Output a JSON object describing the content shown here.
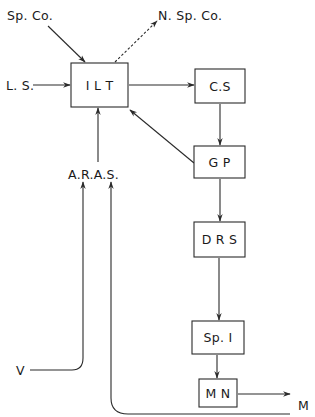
{
  "diagram": {
    "nodes": {
      "ilt": {
        "label": "I L T"
      },
      "cs": {
        "label": "C.S"
      },
      "gp": {
        "label": "G P"
      },
      "drs": {
        "label": "D R S"
      },
      "spi": {
        "label": "Sp. I"
      },
      "mn": {
        "label": "M N"
      }
    },
    "inputs": {
      "spco": {
        "label": "Sp. Co."
      },
      "ls": {
        "label": "L. S."
      },
      "aras": {
        "label": "A.R.A.S."
      },
      "v": {
        "label": "V"
      },
      "m": {
        "label": "M"
      }
    },
    "outputs": {
      "nspco": {
        "label": "N. Sp. Co."
      }
    },
    "edges": [
      {
        "from": "Sp. Co.",
        "to": "I L T",
        "style": "solid"
      },
      {
        "from": "I L T",
        "to": "N. Sp. Co.",
        "style": "dashed"
      },
      {
        "from": "L. S.",
        "to": "I L T",
        "style": "solid"
      },
      {
        "from": "I L T",
        "to": "C.S",
        "style": "solid"
      },
      {
        "from": "C.S",
        "to": "G P",
        "style": "solid"
      },
      {
        "from": "G P",
        "to": "I L T",
        "style": "solid"
      },
      {
        "from": "A.R.A.S.",
        "to": "I L T",
        "style": "solid"
      },
      {
        "from": "G P",
        "to": "D R S",
        "style": "solid"
      },
      {
        "from": "D R S",
        "to": "Sp. I",
        "style": "solid"
      },
      {
        "from": "Sp. I",
        "to": "M N",
        "style": "solid"
      },
      {
        "from": "M N",
        "to": "M",
        "style": "solid"
      },
      {
        "from": "V",
        "to": "A.R.A.S.",
        "style": "solid"
      },
      {
        "from": "M",
        "to": "A.R.A.S.",
        "style": "solid"
      }
    ]
  }
}
